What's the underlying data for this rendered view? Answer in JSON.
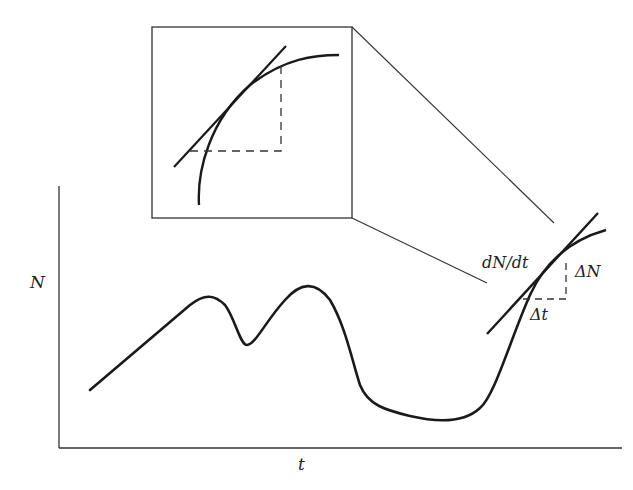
{
  "diagram": {
    "title": "",
    "y_axis_label": "N",
    "x_axis_label": "t",
    "tangent_label": "dN/dt",
    "delta_n_label": "ΔN",
    "delta_t_label": "Δt",
    "inset": {
      "description": "magnified view of curve with tangent line and dashed Δ triangle"
    },
    "colors": {
      "line": "#1a1a1a",
      "thin": "#333333",
      "background": "#ffffff"
    }
  }
}
